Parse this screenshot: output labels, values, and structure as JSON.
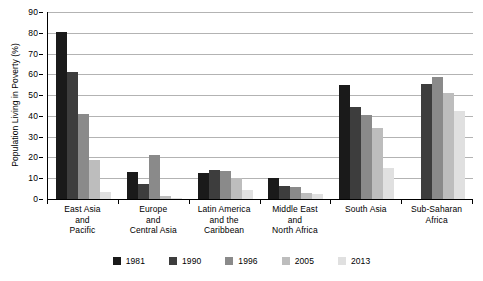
{
  "chart_data": {
    "type": "bar",
    "title": "",
    "xlabel": "",
    "ylabel": "Population Living in Poverty (%)",
    "ylim": [
      0,
      90
    ],
    "ytick_step": 10,
    "yticks": [
      0,
      10,
      20,
      30,
      40,
      50,
      60,
      70,
      80,
      90
    ],
    "grid": true,
    "legend_position": "bottom",
    "categories": [
      "East Asia and Pacific",
      "Europe and Central Asia",
      "Latin America and the Caribbean",
      "Middle East and North Africa",
      "South Asia",
      "Sub-Saharan Africa"
    ],
    "category_lines": [
      [
        "East Asia",
        "and",
        "Pacific"
      ],
      [
        "Europe",
        "and",
        "Central Asia"
      ],
      [
        "Latin America",
        "and the",
        "Caribbean"
      ],
      [
        "Middle East",
        "and",
        "North Africa"
      ],
      [
        "South Asia"
      ],
      [
        "Sub-Saharan",
        "Africa"
      ]
    ],
    "series": [
      {
        "name": "1981",
        "color": "#1a1a1a",
        "values": [
          80.5,
          13.0,
          12.5,
          10.0,
          55.0,
          null
        ]
      },
      {
        "name": "1990",
        "color": "#3d3d3d",
        "values": [
          61.0,
          7.0,
          14.0,
          6.3,
          44.5,
          55.5
        ]
      },
      {
        "name": "1996",
        "color": "#8a8a8a",
        "values": [
          41.0,
          21.0,
          13.5,
          5.8,
          40.5,
          58.5
        ]
      },
      {
        "name": "2005",
        "color": "#bdbdbd",
        "values": [
          19.0,
          1.5,
          10.0,
          2.7,
          34.0,
          51.0
        ]
      },
      {
        "name": "2013",
        "color": "#e0e0e0",
        "values": [
          3.5,
          0.6,
          4.5,
          2.2,
          15.0,
          42.5
        ]
      }
    ]
  },
  "legend": {
    "items": [
      {
        "label": "1981"
      },
      {
        "label": "1990"
      },
      {
        "label": "1996"
      },
      {
        "label": "2005"
      },
      {
        "label": "2013"
      }
    ]
  },
  "colors": {
    "axis": "#000000",
    "gridline": "#b3b3b3",
    "background": "#ffffff"
  }
}
